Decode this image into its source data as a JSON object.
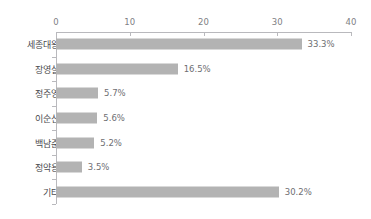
{
  "chart_data": {
    "type": "bar",
    "orientation": "horizontal",
    "title": "",
    "xlabel": "",
    "ylabel": "",
    "xlim": [
      0,
      40
    ],
    "xticks": [
      0,
      10,
      20,
      30,
      40
    ],
    "xtick_labels": [
      "0",
      "10",
      "20",
      "30",
      "40"
    ],
    "grid": false,
    "legend": false,
    "bar_color": "#b3b3b3",
    "axis_color": "#b9b9bd",
    "label_color": "#4a4a4e",
    "value_color": "#6e6e72",
    "categories": [
      "세종대왕",
      "장영실",
      "정주영",
      "이순신",
      "백남준",
      "정약용",
      "기타"
    ],
    "values": [
      33.3,
      16.5,
      5.7,
      5.6,
      5.2,
      3.5,
      30.2
    ],
    "value_labels": [
      "33.3%",
      "16.5%",
      "5.7%",
      "5.6%",
      "5.2%",
      "3.5%",
      "30.2%"
    ]
  }
}
